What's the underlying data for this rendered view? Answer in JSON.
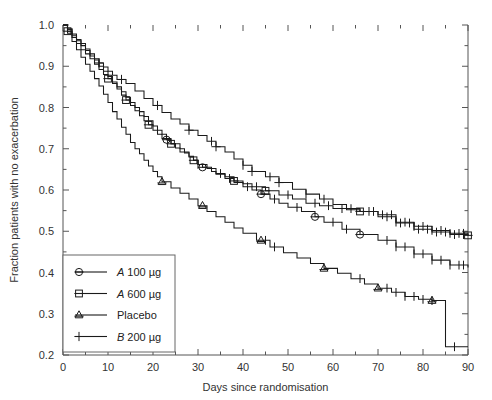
{
  "chart_data": {
    "type": "line",
    "subtype": "kaplan-meier-survival",
    "title": "",
    "xlabel": "Days since randomisation",
    "ylabel": "Fraction patients with no exacerbation",
    "xlim": [
      0,
      90
    ],
    "ylim": [
      0.2,
      1.0
    ],
    "xticks": [
      0,
      10,
      20,
      30,
      40,
      50,
      60,
      70,
      80,
      90
    ],
    "xticklabels": [
      "0",
      "10",
      "20",
      "30",
      "40",
      "50",
      "60",
      "70",
      "80",
      "90"
    ],
    "xminorticks": [
      5,
      15,
      25,
      35,
      45,
      55,
      65,
      75,
      85
    ],
    "yticks": [
      0.2,
      0.3,
      0.4,
      0.5,
      0.6,
      0.7,
      0.8,
      0.9,
      1.0
    ],
    "yticklabels": [
      "0.2",
      "0.3",
      "0.4",
      "0.5",
      "0.6",
      "0.7",
      "0.8",
      "0.9",
      "1.0"
    ],
    "yminorticks": [
      0.25,
      0.35,
      0.45,
      0.55,
      0.65,
      0.75,
      0.85,
      0.95
    ],
    "grid": false,
    "legend_position": "lower left",
    "line_color": "#1a1a1a",
    "series": [
      {
        "name": "A 100 µg",
        "name_italic_prefix": "A",
        "name_rest": "100 µg",
        "marker": "circle",
        "x": [
          0,
          1,
          2,
          3,
          4,
          5,
          6,
          7,
          8,
          9,
          10,
          11,
          12,
          13,
          14,
          15,
          16,
          17,
          18,
          19,
          20,
          21,
          22,
          23,
          24,
          26,
          27,
          28,
          29,
          30,
          31,
          33,
          34,
          36,
          38,
          40,
          42,
          44,
          46,
          48,
          50,
          53,
          56,
          58,
          62,
          66,
          70,
          74,
          78,
          82,
          86,
          90
        ],
        "y": [
          1.0,
          0.99,
          0.975,
          0.962,
          0.95,
          0.938,
          0.925,
          0.915,
          0.9,
          0.888,
          0.875,
          0.862,
          0.85,
          0.838,
          0.825,
          0.812,
          0.8,
          0.79,
          0.778,
          0.768,
          0.755,
          0.745,
          0.735,
          0.722,
          0.712,
          0.7,
          0.69,
          0.682,
          0.672,
          0.662,
          0.655,
          0.645,
          0.638,
          0.628,
          0.618,
          0.608,
          0.6,
          0.59,
          0.578,
          0.568,
          0.558,
          0.548,
          0.535,
          0.522,
          0.505,
          0.492,
          0.478,
          0.462,
          0.445,
          0.43,
          0.418,
          0.412
        ],
        "markers_at_x": [
          23,
          31,
          44,
          56,
          66
        ],
        "censored_x": [
          30,
          37,
          41,
          47,
          52,
          60,
          63,
          72,
          74,
          76,
          78,
          80,
          82,
          84,
          86,
          88,
          89
        ]
      },
      {
        "name": "A 600 µg",
        "name_italic_prefix": "A",
        "name_rest": "600 µg",
        "marker": "square",
        "x": [
          0,
          1,
          2,
          3,
          4,
          5,
          6,
          7,
          8,
          9,
          10,
          11,
          12,
          13,
          14,
          15,
          16,
          17,
          18,
          19,
          20,
          21,
          22,
          24,
          25,
          26,
          28,
          29,
          30,
          32,
          34,
          36,
          38,
          40,
          42,
          45,
          48,
          51,
          54,
          57,
          60,
          63,
          66,
          70,
          74,
          78,
          82,
          86,
          90
        ],
        "y": [
          1.0,
          0.985,
          0.97,
          0.955,
          0.94,
          0.93,
          0.918,
          0.905,
          0.892,
          0.88,
          0.87,
          0.858,
          0.845,
          0.83,
          0.818,
          0.805,
          0.792,
          0.78,
          0.768,
          0.758,
          0.745,
          0.735,
          0.725,
          0.712,
          0.702,
          0.692,
          0.68,
          0.672,
          0.662,
          0.652,
          0.64,
          0.632,
          0.622,
          0.615,
          0.608,
          0.598,
          0.588,
          0.578,
          0.568,
          0.562,
          0.555,
          0.552,
          0.548,
          0.54,
          0.52,
          0.505,
          0.498,
          0.492,
          0.49
        ],
        "markers_at_x": [
          1,
          10,
          14,
          19,
          24,
          29,
          38,
          45,
          66,
          90
        ],
        "censored_x": [
          35,
          43,
          50,
          56,
          59,
          62,
          68,
          71,
          73,
          75,
          77,
          79,
          81,
          83,
          85,
          87,
          89
        ]
      },
      {
        "name": "Placebo",
        "marker": "triangle",
        "x": [
          0,
          1,
          2,
          3,
          4,
          5,
          6,
          7,
          8,
          9,
          10,
          11,
          12,
          13,
          14,
          15,
          16,
          17,
          18,
          19,
          20,
          21,
          22,
          24,
          26,
          28,
          30,
          32,
          34,
          36,
          38,
          40,
          43,
          46,
          49,
          52,
          55,
          58,
          61,
          64,
          67,
          70,
          73,
          76,
          79,
          82,
          85,
          85,
          90
        ],
        "y": [
          1.0,
          0.98,
          0.96,
          0.94,
          0.922,
          0.905,
          0.888,
          0.87,
          0.852,
          0.832,
          0.812,
          0.79,
          0.772,
          0.752,
          0.735,
          0.715,
          0.7,
          0.688,
          0.672,
          0.658,
          0.645,
          0.632,
          0.62,
          0.605,
          0.592,
          0.578,
          0.562,
          0.548,
          0.535,
          0.522,
          0.508,
          0.495,
          0.478,
          0.462,
          0.448,
          0.435,
          0.422,
          0.41,
          0.398,
          0.385,
          0.372,
          0.362,
          0.352,
          0.342,
          0.335,
          0.332,
          0.33,
          0.22,
          0.22
        ],
        "markers_at_x": [
          22,
          31,
          44,
          58,
          70,
          82
        ],
        "censored_x": [
          45,
          47,
          66,
          72,
          74,
          76,
          78,
          80,
          82,
          87
        ]
      },
      {
        "name": "B 200 µg",
        "name_italic_prefix": "B",
        "name_rest": "200 µg",
        "marker": "plus",
        "x": [
          0,
          1,
          2,
          3,
          4,
          5,
          6,
          7,
          8,
          9,
          10,
          11,
          12,
          14,
          16,
          18,
          20,
          22,
          24,
          26,
          28,
          30,
          32,
          34,
          36,
          38,
          40,
          42,
          45,
          48,
          51,
          54,
          57,
          60,
          63,
          66,
          70,
          74,
          78,
          82,
          86,
          90
        ],
        "y": [
          1.0,
          0.99,
          0.978,
          0.965,
          0.955,
          0.942,
          0.93,
          0.918,
          0.908,
          0.898,
          0.888,
          0.878,
          0.868,
          0.858,
          0.84,
          0.822,
          0.805,
          0.788,
          0.772,
          0.76,
          0.745,
          0.732,
          0.718,
          0.705,
          0.692,
          0.675,
          0.66,
          0.645,
          0.632,
          0.618,
          0.602,
          0.59,
          0.578,
          0.565,
          0.555,
          0.548,
          0.535,
          0.522,
          0.512,
          0.502,
          0.495,
          0.49
        ],
        "markers_at_x": [
          8,
          13,
          21,
          28,
          34,
          42,
          48
        ],
        "censored_x": [
          33,
          40,
          46,
          54,
          58,
          64,
          69,
          72,
          74,
          76,
          78,
          80,
          82,
          84,
          86,
          88,
          89
        ]
      }
    ]
  },
  "legend": {
    "entries": [
      {
        "label_italic": "A",
        "label_rest": "100 µg",
        "marker": "circle"
      },
      {
        "label_italic": "A",
        "label_rest": "600 µg",
        "marker": "square"
      },
      {
        "label_italic": "",
        "label_rest": "Placebo",
        "marker": "triangle"
      },
      {
        "label_italic": "B",
        "label_rest": "200 µg",
        "marker": "plus"
      }
    ]
  }
}
